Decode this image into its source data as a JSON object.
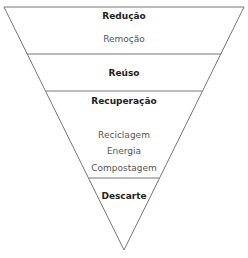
{
  "diagram": {
    "type": "inverted-pyramid",
    "levels": [
      {
        "title": "Redução",
        "items": [
          "Remoção"
        ]
      },
      {
        "title": "Reúso",
        "items": []
      },
      {
        "title": "Recuperação",
        "items": [
          "Reciclagem",
          "Energia",
          "Compostagem"
        ]
      },
      {
        "title": "Descarte",
        "items": []
      }
    ],
    "colors": {
      "line": "#777777",
      "text": "#222222",
      "subtext": "#555555"
    }
  }
}
